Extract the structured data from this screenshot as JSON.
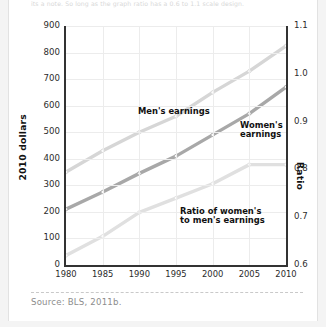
{
  "card": {
    "top_caption": "its a note. So long as the graph ratio has a 0.6 to 1.1 scale design.",
    "source": "Source:  BLS, 2011b."
  },
  "chart_data": {
    "type": "line",
    "title": "",
    "xlabel": "",
    "ylabel": "2010 dollars",
    "ylabel_right": "Ratio",
    "grid": true,
    "legend": "inline-annotations",
    "x": [
      1980,
      1985,
      1990,
      1995,
      2000,
      2005,
      2010
    ],
    "xlim": [
      1980,
      2010
    ],
    "ylim": [
      0,
      900
    ],
    "ylim_right": [
      0.6,
      1.1
    ],
    "yticks": [
      0,
      100,
      200,
      300,
      400,
      500,
      600,
      700,
      800,
      900
    ],
    "yticks_right": [
      "0.6",
      "0.7",
      "0.8",
      "0.9",
      "1.0",
      "1.1"
    ],
    "xticks": [
      "1980",
      "1985",
      "1990",
      "1995",
      "2000",
      "2005",
      "2010"
    ],
    "series": [
      {
        "name": "Men's earnings",
        "axis": "left",
        "color": "#d6d6d6",
        "values": [
          350,
          430,
          500,
          560,
          650,
          730,
          825
        ]
      },
      {
        "name": "Women's earnings",
        "axis": "left",
        "color": "#a8a8a8",
        "values": [
          210,
          275,
          345,
          410,
          490,
          570,
          670
        ]
      },
      {
        "name": "Ratio of women's to men's earnings",
        "axis": "right",
        "color": "#e0e0e0",
        "values": [
          0.62,
          0.66,
          0.71,
          0.74,
          0.77,
          0.81,
          0.81
        ]
      }
    ],
    "annotations": [
      {
        "text": "Men's earnings",
        "x": 1991,
        "y": 640
      },
      {
        "text": "Women's\nearnings",
        "x": 2005,
        "y": 560
      },
      {
        "text": "Ratio of women's\nto men's earnings",
        "x": 1997,
        "y": 235
      }
    ]
  }
}
